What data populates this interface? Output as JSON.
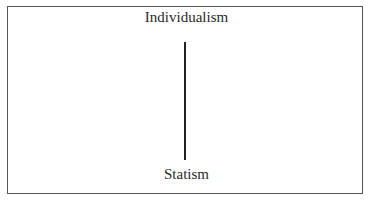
{
  "diagram": {
    "top_label": "Individualism",
    "bottom_label": "Statism",
    "axis": "vertical"
  }
}
